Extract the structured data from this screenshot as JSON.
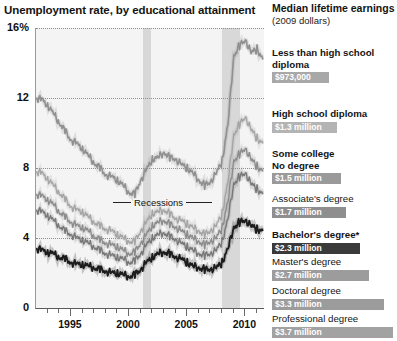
{
  "chart_title": "Unemployment rate, by educational attainment",
  "panel": {
    "heading": "Median lifetime earnings",
    "subheading": "(2009 dollars)"
  },
  "annotations": {
    "recessions_label": "Recessions"
  },
  "earnings": [
    {
      "label": "Less than high school\ndiploma",
      "bold": true,
      "value_text": "$973,000",
      "value": 0.973,
      "bar_color": "#a8a8a8",
      "top": 47,
      "label_lines": 2
    },
    {
      "label": "High school diploma",
      "bold": true,
      "value_text": "$1.3 million",
      "value": 1.3,
      "bar_color": "#b4b4b4",
      "top": 108,
      "label_lines": 1
    },
    {
      "label": "Some college\nNo degree",
      "bold": true,
      "value_text": "$1.5 million",
      "value": 1.5,
      "bar_color": "#9a9a9a",
      "top": 148,
      "label_lines": 2
    },
    {
      "label": "Associate's degree",
      "bold": false,
      "value_text": "$1.7 million",
      "value": 1.7,
      "bar_color": "#8e8e8e",
      "top": 193,
      "label_lines": 1
    },
    {
      "label": "Bachelor's degree*",
      "bold": true,
      "value_text": "$2.3 million",
      "value": 2.3,
      "bar_color": "#3a3a3a",
      "top": 229,
      "label_lines": 1
    },
    {
      "label": "Master's degree",
      "bold": false,
      "value_text": "$2.7 million",
      "value": 2.7,
      "bar_color": "#9c9c9c",
      "top": 256,
      "label_lines": 1
    },
    {
      "label": "Doctoral degree",
      "bold": false,
      "value_text": "$3.3 million",
      "value": 3.3,
      "bar_color": "#9c9c9c",
      "top": 285,
      "label_lines": 1
    },
    {
      "label": "Professional degree",
      "bold": false,
      "value_text": "$3.7 million",
      "value": 3.7,
      "bar_color": "#a2a2a2",
      "top": 313,
      "label_lines": 1
    }
  ],
  "chart_data": {
    "type": "line",
    "title": "Unemployment rate, by educational attainment",
    "xlabel": "",
    "ylabel": "Unemployment rate (%)",
    "xlim": [
      1992.0,
      2011.6
    ],
    "ylim": [
      0,
      16
    ],
    "yticks": [
      0,
      4,
      8,
      12,
      16
    ],
    "ytick_labels": [
      "0",
      "4",
      "8",
      "12",
      "16%"
    ],
    "xticks": [
      1995,
      2000,
      2005,
      2010
    ],
    "xtick_labels": [
      "1995",
      "2000",
      "2005",
      "2010"
    ],
    "x_minor_tick_step": 1,
    "grid": "dotted-horizontal",
    "legend": "right-panel-labels",
    "shaded_regions": [
      {
        "name": "recession-2001",
        "x0": 2001.2,
        "x1": 2001.92
      },
      {
        "name": "recession-2008",
        "x0": 2007.95,
        "x1": 2009.5
      }
    ],
    "x": [
      1992.0,
      1992.5,
      1993.0,
      1993.5,
      1994.0,
      1994.5,
      1995.0,
      1995.5,
      1996.0,
      1996.5,
      1997.0,
      1997.5,
      1998.0,
      1998.5,
      1999.0,
      1999.5,
      2000.0,
      2000.5,
      2001.0,
      2001.5,
      2002.0,
      2002.5,
      2003.0,
      2003.5,
      2004.0,
      2004.5,
      2005.0,
      2005.5,
      2006.0,
      2006.5,
      2007.0,
      2007.5,
      2008.0,
      2008.5,
      2009.0,
      2009.5,
      2010.0,
      2010.5,
      2011.0,
      2011.5
    ],
    "series": [
      {
        "name": "Less than high school diploma",
        "color": "#909090",
        "width": 1.6,
        "values": [
          12.0,
          11.9,
          11.6,
          11.1,
          10.6,
          10.1,
          9.6,
          9.4,
          9.1,
          8.7,
          8.3,
          8.0,
          7.6,
          7.5,
          7.3,
          7.0,
          6.6,
          6.5,
          7.3,
          7.9,
          8.5,
          8.6,
          8.9,
          8.6,
          8.5,
          8.2,
          8.0,
          7.7,
          7.3,
          7.0,
          7.2,
          7.7,
          8.4,
          10.5,
          14.4,
          15.0,
          15.3,
          14.6,
          14.8,
          14.2
        ]
      },
      {
        "name": "High school diploma",
        "color": "#a5a5a5",
        "width": 1.4,
        "values": [
          7.8,
          7.7,
          7.4,
          7.0,
          6.6,
          6.2,
          5.8,
          5.6,
          5.5,
          5.2,
          4.9,
          4.7,
          4.5,
          4.4,
          4.2,
          4.0,
          3.8,
          3.8,
          4.4,
          4.9,
          5.4,
          5.5,
          5.6,
          5.4,
          5.1,
          5.0,
          4.8,
          4.6,
          4.4,
          4.2,
          4.4,
          4.7,
          5.4,
          7.2,
          9.9,
          10.5,
          10.9,
          10.2,
          9.7,
          9.4
        ]
      },
      {
        "name": "Some college, no degree",
        "color": "#8c8c8c",
        "width": 1.4,
        "values": [
          6.5,
          6.4,
          6.2,
          5.9,
          5.5,
          5.2,
          4.9,
          4.7,
          4.6,
          4.4,
          4.1,
          3.9,
          3.7,
          3.6,
          3.5,
          3.3,
          3.1,
          3.2,
          3.7,
          4.2,
          4.7,
          4.9,
          5.0,
          4.8,
          4.6,
          4.4,
          4.2,
          4.0,
          3.8,
          3.6,
          3.8,
          4.0,
          4.6,
          6.1,
          8.4,
          8.8,
          9.1,
          8.5,
          8.1,
          7.8
        ]
      },
      {
        "name": "Associate's degree",
        "color": "#787878",
        "width": 1.4,
        "values": [
          5.6,
          5.5,
          5.3,
          5.0,
          4.7,
          4.4,
          4.2,
          4.0,
          3.9,
          3.7,
          3.5,
          3.3,
          3.1,
          3.0,
          2.9,
          2.8,
          2.6,
          2.7,
          3.1,
          3.6,
          4.0,
          4.2,
          4.3,
          4.1,
          3.9,
          3.7,
          3.5,
          3.3,
          3.1,
          3.0,
          3.1,
          3.3,
          3.8,
          5.1,
          7.1,
          7.5,
          7.7,
          7.1,
          6.8,
          6.5
        ]
      },
      {
        "name": "Bachelor's degree and higher",
        "color": "#1c1c1c",
        "width": 1.8,
        "values": [
          3.4,
          3.3,
          3.2,
          3.1,
          2.9,
          2.8,
          2.6,
          2.5,
          2.5,
          2.4,
          2.3,
          2.2,
          2.1,
          2.0,
          2.0,
          1.9,
          1.8,
          1.9,
          2.2,
          2.6,
          2.9,
          3.1,
          3.2,
          3.1,
          2.9,
          2.8,
          2.6,
          2.4,
          2.3,
          2.2,
          2.2,
          2.3,
          2.6,
          3.4,
          4.6,
          4.9,
          5.0,
          4.7,
          4.5,
          4.4
        ]
      }
    ]
  }
}
